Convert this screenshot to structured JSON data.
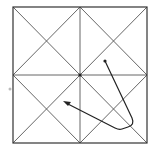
{
  "diagram": {
    "type": "grid-path-puzzle",
    "grid": {
      "left": 13,
      "top": 7,
      "right": 147,
      "bottom": 143,
      "divisions": 2,
      "diagonals": true,
      "line_color": "#555555",
      "border_color": "#333333"
    },
    "center_dot": {
      "x": 80,
      "y": 75
    },
    "path": {
      "start": {
        "x": 105,
        "y": 61
      },
      "corner": {
        "x": 133,
        "y": 124
      },
      "end": {
        "x": 63,
        "y": 102
      },
      "color": "#222222"
    },
    "stray_dot": {
      "x": 10,
      "y": 89,
      "color": "#bbbbbb"
    }
  }
}
